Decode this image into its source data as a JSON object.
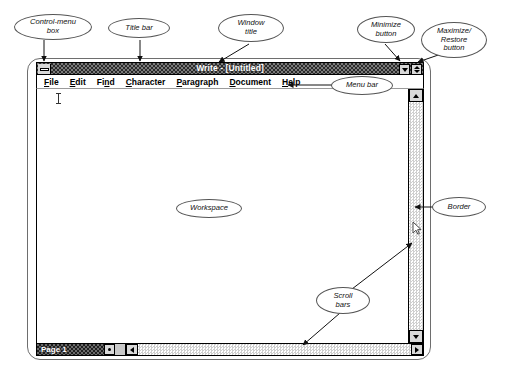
{
  "window": {
    "title": "Write - [Untitled]",
    "control_menu_box": "control-menu-box",
    "minimize_button": "minimize",
    "maximize_restore_button": "maximize-restore",
    "menu_items": [
      {
        "label": "File",
        "accel": "F"
      },
      {
        "label": "Edit",
        "accel": "E"
      },
      {
        "label": "Find",
        "accel": "n"
      },
      {
        "label": "Character",
        "accel": "C"
      },
      {
        "label": "Paragraph",
        "accel": "P"
      },
      {
        "label": "Document",
        "accel": "D"
      },
      {
        "label": "Help",
        "accel": "H"
      }
    ],
    "status": {
      "page_label": "Page 1"
    },
    "workspace_text": ""
  },
  "callouts": [
    {
      "id": "control-menu-box",
      "text": "Control-menu\nbox"
    },
    {
      "id": "title-bar",
      "text": "Title bar"
    },
    {
      "id": "window-title",
      "text": "Window\ntitle"
    },
    {
      "id": "minimize-button",
      "text": "Minimize\nbutton"
    },
    {
      "id": "maximize-restore",
      "text": "Maximize/\nRestore\nbutton"
    },
    {
      "id": "menu-bar",
      "text": "Menu bar"
    },
    {
      "id": "workspace",
      "text": "Workspace"
    },
    {
      "id": "border",
      "text": "Border"
    },
    {
      "id": "scroll-bars",
      "text": "Scroll\nbars"
    }
  ],
  "colors": {
    "titlebar_dark": "#2a2a2a",
    "titlebar_light": "#7a7a7a",
    "button_face": "#d9d9d9",
    "outline": "#000000",
    "callout_stroke": "#555555",
    "page_bg": "#ffffff"
  }
}
